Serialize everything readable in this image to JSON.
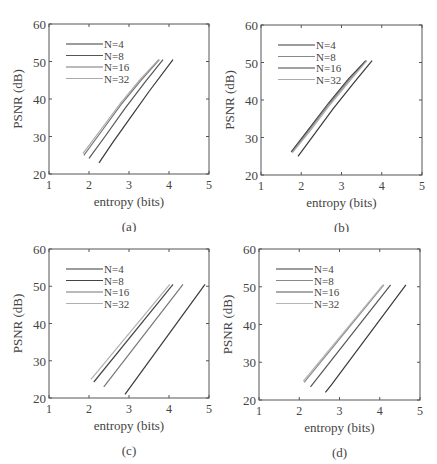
{
  "figure": {
    "panel_labels": [
      "(a)",
      "(b)",
      "(c)",
      "(d)"
    ]
  },
  "chart_data": [
    {
      "type": "line",
      "panel": "(a)",
      "title": "",
      "xlabel": "entropy (bits)",
      "ylabel": "PSNR (dB)",
      "xlim": [
        1,
        5
      ],
      "ylim": [
        20,
        60
      ],
      "xticks": [
        1,
        2,
        3,
        4,
        5
      ],
      "yticks": [
        20,
        30,
        40,
        50,
        60
      ],
      "grid": false,
      "legend_position": "upper-left",
      "series": [
        {
          "name": "N=4",
          "color": "#3a3a3a",
          "x": [
            2.25,
            2.6,
            3.0,
            3.5,
            4.1
          ],
          "y": [
            23,
            28.5,
            34.5,
            42,
            50.5
          ]
        },
        {
          "name": "N=8",
          "color": "#555555",
          "x": [
            2.0,
            2.4,
            2.9,
            3.4,
            3.85
          ],
          "y": [
            24.2,
            30,
            37.5,
            44.5,
            50.5
          ]
        },
        {
          "name": "N=16",
          "color": "#777777",
          "x": [
            1.87,
            2.3,
            2.8,
            3.3,
            3.76
          ],
          "y": [
            25,
            31.2,
            38.5,
            45,
            50.5
          ]
        },
        {
          "name": "N=32",
          "color": "#aaaaaa",
          "x": [
            1.85,
            2.28,
            2.78,
            3.28,
            3.74
          ],
          "y": [
            25.5,
            31.6,
            38.8,
            45.2,
            50.5
          ]
        }
      ]
    },
    {
      "type": "line",
      "panel": "(b)",
      "title": "",
      "xlabel": "entropy (bits)",
      "ylabel": "PSNR (dB)",
      "xlim": [
        1,
        5
      ],
      "ylim": [
        20,
        60
      ],
      "xticks": [
        1,
        2,
        3,
        4,
        5
      ],
      "yticks": [
        20,
        30,
        40,
        50,
        60
      ],
      "grid": false,
      "legend_position": "upper-left",
      "series": [
        {
          "name": "N=4",
          "color": "#3a3a3a",
          "x": [
            1.92,
            2.3,
            2.8,
            3.3,
            3.76
          ],
          "y": [
            25,
            30.5,
            37.8,
            44.5,
            50.5
          ]
        },
        {
          "name": "N=8",
          "color": "#888888",
          "x": [
            1.77,
            2.2,
            2.7,
            3.2,
            3.62
          ],
          "y": [
            26,
            32,
            39,
            45.5,
            50.5
          ]
        },
        {
          "name": "N=16",
          "color": "#444444",
          "x": [
            1.75,
            2.18,
            2.68,
            3.18,
            3.6
          ],
          "y": [
            26.2,
            32.2,
            39.2,
            45.7,
            50.5
          ]
        },
        {
          "name": "N=32",
          "color": "#aaaaaa",
          "x": [
            1.78,
            2.22,
            2.72,
            3.22,
            3.63
          ],
          "y": [
            26,
            31.8,
            38.8,
            45.3,
            50.5
          ]
        }
      ]
    },
    {
      "type": "line",
      "panel": "(c)",
      "title": "",
      "xlabel": "entropy (bits)",
      "ylabel": "PSNR (dB)",
      "xlim": [
        1,
        5
      ],
      "ylim": [
        20,
        60
      ],
      "xticks": [
        1,
        2,
        3,
        4,
        5
      ],
      "yticks": [
        20,
        30,
        40,
        50,
        60
      ],
      "grid": false,
      "legend_position": "upper-left",
      "series": [
        {
          "name": "N=4",
          "color": "#3a3a3a",
          "x": [
            2.9,
            4.9
          ],
          "y": [
            21,
            50.5
          ]
        },
        {
          "name": "N=8",
          "color": "#444444",
          "x": [
            2.12,
            4.1
          ],
          "y": [
            24.3,
            50.5
          ]
        },
        {
          "name": "N=16",
          "color": "#777777",
          "x": [
            2.37,
            4.35
          ],
          "y": [
            23,
            50.5
          ]
        },
        {
          "name": "N=32",
          "color": "#b0b0b0",
          "x": [
            2.05,
            4.02
          ],
          "y": [
            25,
            50.5
          ]
        }
      ]
    },
    {
      "type": "line",
      "panel": "(d)",
      "title": "",
      "xlabel": "entropy (bits)",
      "ylabel": "PSNR (dB)",
      "xlim": [
        1,
        5
      ],
      "ylim": [
        20,
        60
      ],
      "xticks": [
        1,
        2,
        3,
        4,
        5
      ],
      "yticks": [
        20,
        30,
        40,
        50,
        60
      ],
      "grid": false,
      "legend_position": "upper-left",
      "series": [
        {
          "name": "N=4",
          "color": "#3a3a3a",
          "x": [
            2.65,
            2.8,
            4.65
          ],
          "y": [
            22,
            24,
            50.5
          ]
        },
        {
          "name": "N=8",
          "color": "#888888",
          "x": [
            2.12,
            4.1
          ],
          "y": [
            24.7,
            50.5
          ]
        },
        {
          "name": "N=16",
          "color": "#555555",
          "x": [
            2.28,
            4.27
          ],
          "y": [
            23.5,
            50.5
          ]
        },
        {
          "name": "N=32",
          "color": "#b5b5b5",
          "x": [
            2.1,
            4.08
          ],
          "y": [
            25,
            50.5
          ]
        }
      ]
    }
  ]
}
